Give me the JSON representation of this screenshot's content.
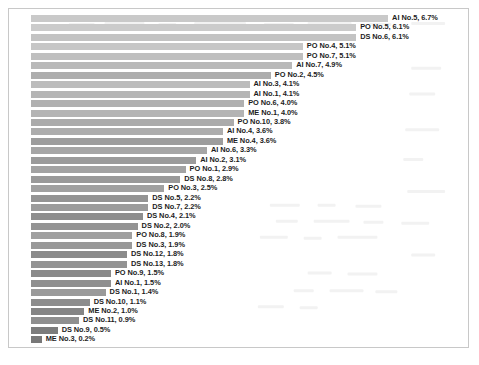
{
  "chart_data": {
    "type": "bar",
    "orientation": "horizontal",
    "title": "",
    "subtitle": "",
    "xlabel": "",
    "ylabel": "",
    "xlim": [
      0,
      6.7
    ],
    "grid": false,
    "legend": false,
    "axis_visible": false,
    "tick_labels": [],
    "value_suffix": "%",
    "sorted": "descending",
    "categories": [
      "AI No.5",
      "PO No.5",
      "DS No.6",
      "PO No.4",
      "PO No.7",
      "AI No.7",
      "PO No.2",
      "AI No.3",
      "AI No.1",
      "PO No.6",
      "ME No.1",
      "PO No.10",
      "AI No.4",
      "ME No.4",
      "AI No.6",
      "AI No.2",
      "PO No.1",
      "DS No.8",
      "PO No.3",
      "DS No.5",
      "DS No.7",
      "DS No.4",
      "DS No.2",
      "PO No.8",
      "DS No.3",
      "DS No.12",
      "DS No.13",
      "PO No.9",
      "AI No.1",
      "DS No.1",
      "DS No.10",
      "ME No.2",
      "DS No.11",
      "DS No.9",
      "ME No.3"
    ],
    "values": [
      6.7,
      6.1,
      6.1,
      5.1,
      5.1,
      4.9,
      4.5,
      4.1,
      4.1,
      4.0,
      4.0,
      3.8,
      3.6,
      3.6,
      3.3,
      3.1,
      2.9,
      2.8,
      2.5,
      2.2,
      2.2,
      2.1,
      2.0,
      1.9,
      1.9,
      1.8,
      1.8,
      1.5,
      1.5,
      1.4,
      1.1,
      1.0,
      0.9,
      0.5,
      0.2
    ],
    "bars": [
      {
        "label": "AI No.5, 6.7%",
        "category": "AI No.5",
        "value": 6.7,
        "color": "#c9c9c9"
      },
      {
        "label": "PO No.5, 6.1%",
        "category": "PO No.5",
        "value": 6.1,
        "color": "#cbcbcb"
      },
      {
        "label": "DS No.6, 6.1%",
        "category": "DS No.6",
        "value": 6.1,
        "color": "#c3c3c3"
      },
      {
        "label": "PO No.4, 5.1%",
        "category": "PO No.4",
        "value": 5.1,
        "color": "#c6c6c6"
      },
      {
        "label": "PO No.7, 5.1%",
        "category": "PO No.7",
        "value": 5.1,
        "color": "#bfbfbf"
      },
      {
        "label": "AI No.7, 4.9%",
        "category": "AI No.7",
        "value": 4.9,
        "color": "#b9b9b9"
      },
      {
        "label": "PO No.2, 4.5%",
        "category": "PO No.2",
        "value": 4.5,
        "color": "#aeaeae"
      },
      {
        "label": "AI No.3, 4.1%",
        "category": "AI No.3",
        "value": 4.1,
        "color": "#bcbcbc"
      },
      {
        "label": "AI No.1, 4.1%",
        "category": "AI No.1",
        "value": 4.1,
        "color": "#b5b5b5"
      },
      {
        "label": "PO No.6, 4.0%",
        "category": "PO No.6",
        "value": 4.0,
        "color": "#b0b0b0"
      },
      {
        "label": "ME No.1, 4.0%",
        "category": "ME No.1",
        "value": 4.0,
        "color": "#b4b4b4"
      },
      {
        "label": "PO No.10, 3.8%",
        "category": "PO No.10",
        "value": 3.8,
        "color": "#ababab"
      },
      {
        "label": "AI No.4, 3.6%",
        "category": "AI No.4",
        "value": 3.6,
        "color": "#adadad"
      },
      {
        "label": "ME No.4, 3.6%",
        "category": "ME No.4",
        "value": 3.6,
        "color": "#9d9d9d"
      },
      {
        "label": "AI No.6, 3.3%",
        "category": "AI No.6",
        "value": 3.3,
        "color": "#a6a6a6"
      },
      {
        "label": "AI No.2, 3.1%",
        "category": "AI No.2",
        "value": 3.1,
        "color": "#9b9b9b"
      },
      {
        "label": "PO No.1, 2.9%",
        "category": "PO No.1",
        "value": 2.9,
        "color": "#a3a3a3"
      },
      {
        "label": "DS No.8, 2.8%",
        "category": "DS No.8",
        "value": 2.8,
        "color": "#9a9a9a"
      },
      {
        "label": "PO No.3, 2.5%",
        "category": "PO No.3",
        "value": 2.5,
        "color": "#a1a1a1"
      },
      {
        "label": "DS No.5, 2.2%",
        "category": "DS No.5",
        "value": 2.2,
        "color": "#949494"
      },
      {
        "label": "DS No.7, 2.2%",
        "category": "DS No.7",
        "value": 2.2,
        "color": "#9c9c9c"
      },
      {
        "label": "DS No.4, 2.1%",
        "category": "DS No.4",
        "value": 2.1,
        "color": "#8e8e8e"
      },
      {
        "label": "DS No.2, 2.0%",
        "category": "DS No.2",
        "value": 2.0,
        "color": "#949494"
      },
      {
        "label": "PO No.8, 1.9%",
        "category": "PO No.8",
        "value": 1.9,
        "color": "#a0a0a0"
      },
      {
        "label": "DS No.3, 1.9%",
        "category": "DS No.3",
        "value": 1.9,
        "color": "#999999"
      },
      {
        "label": "DS No.12, 1.8%",
        "category": "DS No.12",
        "value": 1.8,
        "color": "#8b8b8b"
      },
      {
        "label": "DS No.13, 1.8%",
        "category": "DS No.13",
        "value": 1.8,
        "color": "#939393"
      },
      {
        "label": "PO No.9, 1.5%",
        "category": "PO No.9",
        "value": 1.5,
        "color": "#8a8a8a"
      },
      {
        "label": "AI No.1, 1.5%",
        "category": "AI No.1",
        "value": 1.5,
        "color": "#8f8f8f"
      },
      {
        "label": "DS No.1, 1.4%",
        "category": "DS No.1",
        "value": 1.4,
        "color": "#9a9a9a"
      },
      {
        "label": "DS No.10, 1.1%",
        "category": "DS No.10",
        "value": 1.1,
        "color": "#8d8d8d"
      },
      {
        "label": "ME No.2, 1.0%",
        "category": "ME No.2",
        "value": 1.0,
        "color": "#858585"
      },
      {
        "label": "DS No.11, 0.9%",
        "category": "DS No.11",
        "value": 0.9,
        "color": "#8f8f8f"
      },
      {
        "label": "DS No.9, 0.5%",
        "category": "DS No.9",
        "value": 0.5,
        "color": "#7c7c7c"
      },
      {
        "label": "ME No.3, 0.2%",
        "category": "ME No.3",
        "value": 0.2,
        "color": "#787878"
      }
    ]
  },
  "layout": {
    "bar_pitch_px": 9.45,
    "bar_height_px": 7,
    "bar_top_px": 1,
    "px_per_percent": 53.3,
    "label_gap_px": 4,
    "frame_border_color": "#c8c8c8"
  }
}
